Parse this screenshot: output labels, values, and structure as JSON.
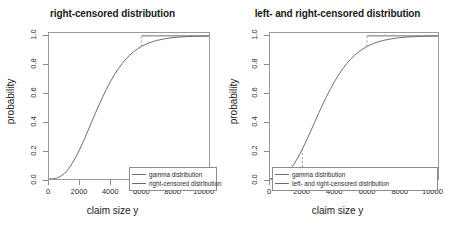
{
  "figure": {
    "width": 450,
    "height": 230,
    "background": "#ffffff",
    "line_color": "#6e6e6e",
    "axis_color": "#8c8c8c",
    "text_color": "#1a1a1a"
  },
  "chart_data": [
    {
      "type": "line",
      "title": "right-censored distribution",
      "xlabel": "claim size y",
      "ylabel": "probability",
      "xlim": [
        0,
        10400
      ],
      "ylim": [
        0,
        1.02
      ],
      "xticks": [
        0,
        2000,
        4000,
        6000,
        8000,
        10000
      ],
      "xticklabels": [
        "0",
        "2000",
        "4000",
        "6000",
        "8000",
        "10000"
      ],
      "yticks": [
        0.0,
        0.2,
        0.4,
        0.6,
        0.8,
        1.0
      ],
      "yticklabels": [
        "0.0",
        "0.2",
        "0.4",
        "0.6",
        "0.8",
        "1.0"
      ],
      "grid": false,
      "legend_position": "bottom-right",
      "legend": [
        "gamma distribution",
        "left- and right-censored distribution"
      ],
      "series": [
        {
          "name": "gamma distribution",
          "x": [
            0,
            250,
            500,
            750,
            1000,
            1250,
            1500,
            1750,
            2000,
            2250,
            2500,
            2750,
            3000,
            3250,
            3500,
            3750,
            4000,
            4250,
            4500,
            4750,
            5000,
            5250,
            5500,
            5750,
            6000,
            6500,
            7000,
            7500,
            8000,
            8500,
            9000,
            9500,
            10000,
            10400
          ],
          "y": [
            0.0,
            0.001,
            0.006,
            0.018,
            0.038,
            0.068,
            0.107,
            0.154,
            0.208,
            0.267,
            0.329,
            0.393,
            0.456,
            0.517,
            0.576,
            0.631,
            0.682,
            0.728,
            0.769,
            0.806,
            0.838,
            0.866,
            0.889,
            0.909,
            0.926,
            0.951,
            0.968,
            0.979,
            0.987,
            0.992,
            0.995,
            0.997,
            0.998,
            0.999
          ]
        },
        {
          "name": "right-censored distribution",
          "censor_right_at": 6000,
          "censor_right_prob": 0.926,
          "note": "jump to 1.0 at y=6000, flat thereafter"
        }
      ],
      "annotations": [
        {
          "kind": "vertical-dashed",
          "x": 6000,
          "y_from": 0.926,
          "y_to": 1.0
        },
        {
          "kind": "horizontal-step",
          "x_from": 6000,
          "x_to": 10400,
          "y": 1.0
        }
      ]
    },
    {
      "type": "line",
      "title": "left- and right-censored distribution",
      "xlabel": "claim size y",
      "ylabel": "probability",
      "xlim": [
        0,
        10400
      ],
      "ylim": [
        0,
        1.02
      ],
      "xticks": [
        0,
        2000,
        4000,
        6000,
        8000,
        10000
      ],
      "xticklabels": [
        "0",
        "2000",
        "4000",
        "6000",
        "8000",
        "10000"
      ],
      "yticks": [
        0.0,
        0.2,
        0.4,
        0.6,
        0.8,
        1.0
      ],
      "yticklabels": [
        "0.0",
        "0.2",
        "0.4",
        "0.6",
        "0.8",
        "1.0"
      ],
      "grid": false,
      "legend_position": "bottom-right",
      "legend": [
        "gamma distribution",
        "left- and right-censored distribution"
      ],
      "series": [
        {
          "name": "gamma distribution",
          "x": [
            0,
            250,
            500,
            750,
            1000,
            1250,
            1500,
            1750,
            2000,
            2250,
            2500,
            2750,
            3000,
            3250,
            3500,
            3750,
            4000,
            4250,
            4500,
            4750,
            5000,
            5250,
            5500,
            5750,
            6000,
            6500,
            7000,
            7500,
            8000,
            8500,
            9000,
            9500,
            10000,
            10400
          ],
          "y": [
            0.0,
            0.001,
            0.006,
            0.018,
            0.038,
            0.068,
            0.107,
            0.154,
            0.208,
            0.267,
            0.329,
            0.393,
            0.456,
            0.517,
            0.576,
            0.631,
            0.682,
            0.728,
            0.769,
            0.806,
            0.838,
            0.866,
            0.889,
            0.909,
            0.926,
            0.951,
            0.968,
            0.979,
            0.987,
            0.992,
            0.995,
            0.997,
            0.998,
            0.999
          ]
        },
        {
          "name": "left- and right-censored distribution",
          "censor_left_at": 2000,
          "censor_left_prob": 0.208,
          "censor_right_at": 6000,
          "censor_right_prob": 0.926,
          "note": "flat at 0 until y=2000, jump up; jump to 1.0 at y=6000"
        }
      ],
      "annotations": [
        {
          "kind": "horizontal-step",
          "x_from": 0,
          "x_to": 2000,
          "y": 0.0
        },
        {
          "kind": "vertical-dashed",
          "x": 2000,
          "y_from": 0.0,
          "y_to": 0.208
        },
        {
          "kind": "vertical-dashed",
          "x": 6000,
          "y_from": 0.926,
          "y_to": 1.0
        },
        {
          "kind": "horizontal-step",
          "x_from": 6000,
          "x_to": 10400,
          "y": 1.0
        }
      ]
    }
  ],
  "panels": [
    {
      "id": "left",
      "title": "right-censored distribution",
      "xlabel": "claim size y",
      "ylabel": "probability",
      "xticklabels": [
        "0",
        "2000",
        "4000",
        "6000",
        "8000",
        "10000"
      ],
      "yticklabels": [
        "0.0",
        "0.2",
        "0.4",
        "0.6",
        "0.8",
        "1.0"
      ],
      "legend": [
        {
          "label": "gamma distribution"
        },
        {
          "label": "right-censored distribution"
        }
      ]
    },
    {
      "id": "right",
      "title": "left- and right-censored distribution",
      "xlabel": "claim size y",
      "ylabel": "probability",
      "xticklabels": [
        "0",
        "2000",
        "4000",
        "6000",
        "8000",
        "10000"
      ],
      "yticklabels": [
        "0.0",
        "0.2",
        "0.4",
        "0.6",
        "0.8",
        "1.0"
      ],
      "legend": [
        {
          "label": "gamma distribution"
        },
        {
          "label": "left- and right-censored distribution"
        }
      ]
    }
  ]
}
